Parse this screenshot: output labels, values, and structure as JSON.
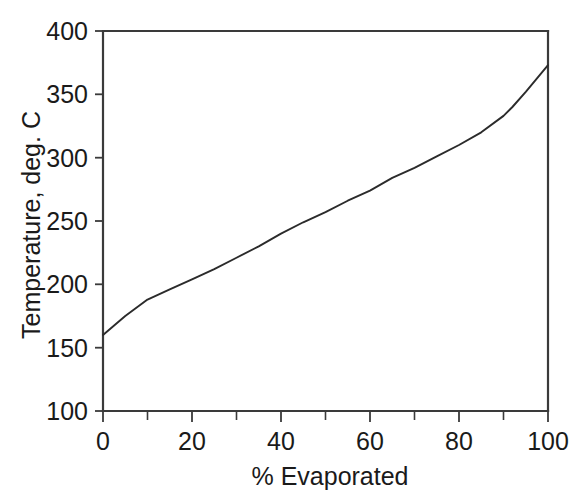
{
  "chart_data": {
    "type": "line",
    "title": "",
    "subtitle": "",
    "xlabel": "% Evaporated",
    "ylabel": "Temperature, deg. C",
    "xlim": [
      0,
      100
    ],
    "ylim": [
      100,
      400
    ],
    "xticks": [
      0,
      20,
      40,
      60,
      80,
      100
    ],
    "xtick_labels": [
      "0",
      "20",
      "40",
      "60",
      "80",
      "100"
    ],
    "xminor_ticks": [
      10,
      30,
      50,
      70,
      90
    ],
    "yticks": [
      100,
      150,
      200,
      250,
      300,
      350,
      400
    ],
    "ytick_labels": [
      "100",
      "150",
      "200",
      "250",
      "300",
      "350",
      "400"
    ],
    "grid": false,
    "legend": false,
    "legend_position": "none",
    "line_color": "#2b2b2b",
    "axis_color": "#3a3a3a",
    "background_color": "#ffffff",
    "series": [
      {
        "name": "Distillation curve",
        "x": [
          0,
          5,
          10,
          15,
          20,
          25,
          30,
          35,
          40,
          45,
          50,
          55,
          60,
          65,
          70,
          75,
          80,
          85,
          90,
          92,
          95,
          100
        ],
        "values": [
          160,
          175,
          188,
          196,
          204,
          212,
          221,
          230,
          240,
          249,
          257,
          266,
          274,
          284,
          292,
          301,
          310,
          320,
          333,
          340,
          352,
          373
        ]
      }
    ]
  },
  "axes": {
    "x_axis_label": "% Evaporated",
    "y_axis_label": "Temperature, deg. C"
  },
  "ticks": {
    "x": [
      "0",
      "20",
      "40",
      "60",
      "80",
      "100"
    ],
    "y": [
      "100",
      "150",
      "200",
      "250",
      "300",
      "350",
      "400"
    ]
  }
}
